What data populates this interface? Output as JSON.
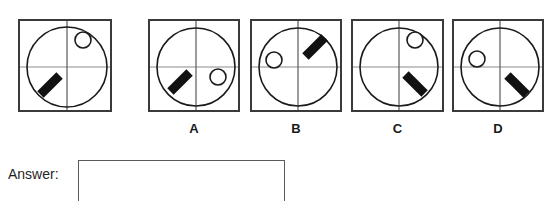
{
  "question": {
    "type": "visual-analogy-rotation-puzzle",
    "colors": {
      "frame_stroke": "#3a3a3a",
      "circle_stroke": "#1a1a1a",
      "axis_stroke": "#8c8c8c",
      "bar_fill": "#111111",
      "small_circle_stroke": "#1a1a1a",
      "small_circle_fill": "#ffffff",
      "background": "#ffffff",
      "text": "#1f1f1f"
    }
  },
  "reference": {
    "label": "",
    "name": "reference-figure",
    "box": {
      "x": 18,
      "y": 19,
      "w": 94,
      "h": 93
    },
    "circle": {
      "cx": 47,
      "cy": 46,
      "r": 40
    },
    "axes": {
      "vertical_x": 47,
      "horizontal_y": 46
    },
    "small_circle": {
      "cx": 63,
      "cy": 19,
      "r": 8,
      "quadrant": "upper-right"
    },
    "bar": {
      "cx": 30,
      "cy": 64,
      "length": 27,
      "width": 9,
      "angle_deg": -45,
      "orientation": "slash",
      "quadrant": "lower-left"
    }
  },
  "options": [
    {
      "label": "A",
      "name": "option-a",
      "box": {
        "x": 148,
        "y": 19,
        "w": 92,
        "h": 93
      },
      "circle": {
        "cx": 46,
        "cy": 46,
        "r": 39
      },
      "axes": {
        "vertical_x": 46,
        "horizontal_y": 46
      },
      "small_circle": {
        "cx": 68,
        "cy": 56,
        "r": 8,
        "quadrant": "lower-right"
      },
      "bar": {
        "cx": 30,
        "cy": 61,
        "length": 27,
        "width": 9,
        "angle_deg": -45,
        "orientation": "slash",
        "quadrant": "lower-left"
      }
    },
    {
      "label": "B",
      "name": "option-b",
      "box": {
        "x": 250,
        "y": 19,
        "w": 92,
        "h": 93
      },
      "circle": {
        "cx": 46,
        "cy": 46,
        "r": 39
      },
      "axes": {
        "vertical_x": 46,
        "horizontal_y": 46
      },
      "small_circle": {
        "cx": 22,
        "cy": 39,
        "r": 8,
        "quadrant": "upper-left"
      },
      "bar": {
        "cx": 63,
        "cy": 26,
        "length": 27,
        "width": 9,
        "angle_deg": -45,
        "orientation": "slash",
        "quadrant": "upper-right"
      }
    },
    {
      "label": "C",
      "name": "option-c",
      "box": {
        "x": 351,
        "y": 19,
        "w": 93,
        "h": 93
      },
      "circle": {
        "cx": 46,
        "cy": 46,
        "r": 39
      },
      "axes": {
        "vertical_x": 46,
        "horizontal_y": 46
      },
      "small_circle": {
        "cx": 62,
        "cy": 19,
        "r": 8,
        "quadrant": "upper-right"
      },
      "bar": {
        "cx": 62,
        "cy": 63,
        "length": 27,
        "width": 9,
        "angle_deg": 45,
        "orientation": "backslash",
        "quadrant": "lower-right"
      }
    },
    {
      "label": "D",
      "name": "option-d",
      "box": {
        "x": 452,
        "y": 19,
        "w": 92,
        "h": 93
      },
      "circle": {
        "cx": 46,
        "cy": 46,
        "r": 39
      },
      "axes": {
        "vertical_x": 46,
        "horizontal_y": 46
      },
      "small_circle": {
        "cx": 23,
        "cy": 38,
        "r": 8,
        "quadrant": "upper-left"
      },
      "bar": {
        "cx": 63,
        "cy": 64,
        "length": 27,
        "width": 9,
        "angle_deg": 45,
        "orientation": "backslash",
        "quadrant": "lower-right"
      }
    }
  ],
  "answer": {
    "label": "Answer:",
    "value": "",
    "placeholder": ""
  }
}
